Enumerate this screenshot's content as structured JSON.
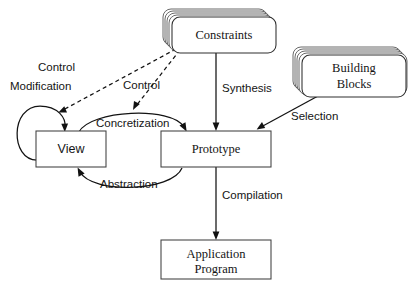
{
  "diagram": {
    "background_color": "#ffffff",
    "line_color": "#121212",
    "text_color": "#141414",
    "nodes": [
      {
        "id": "constraints",
        "label": "Constraints",
        "shape": "stacked-rounded-rectangle",
        "stack_layers": 5
      },
      {
        "id": "building_blocks",
        "label_line1": "Building",
        "label_line2": "Blocks",
        "shape": "stacked-rounded-rectangle",
        "stack_layers": 5
      },
      {
        "id": "view",
        "label": "View",
        "shape": "rectangle"
      },
      {
        "id": "prototype",
        "label": "Prototype",
        "shape": "rectangle"
      },
      {
        "id": "application_program",
        "label_line1": "Application",
        "label_line2": "Program",
        "shape": "rectangle"
      }
    ],
    "edges": [
      {
        "id": "modification",
        "label": "Modification",
        "from": "view",
        "to": "view",
        "style": "solid",
        "shape": "self-loop"
      },
      {
        "id": "control_to_view",
        "label": "Control",
        "from": "constraints",
        "to": "view",
        "style": "dashed",
        "shape": "straight"
      },
      {
        "id": "control_to_concretization",
        "label": "Control",
        "from": "constraints",
        "to": "concretization",
        "style": "dashed",
        "shape": "straight"
      },
      {
        "id": "synthesis",
        "label": "Synthesis",
        "from": "constraints",
        "to": "prototype",
        "style": "solid",
        "shape": "straight"
      },
      {
        "id": "selection",
        "label": "Selection",
        "from": "building_blocks",
        "to": "prototype",
        "style": "solid",
        "shape": "straight"
      },
      {
        "id": "concretization",
        "label": "Concretization",
        "from": "view",
        "to": "prototype",
        "style": "solid",
        "shape": "curve-above"
      },
      {
        "id": "abstraction",
        "label": "Abstraction",
        "from": "prototype",
        "to": "view",
        "style": "solid",
        "shape": "curve-below"
      },
      {
        "id": "compilation",
        "label": "Compilation",
        "from": "prototype",
        "to": "application_program",
        "style": "solid",
        "shape": "straight"
      }
    ]
  }
}
